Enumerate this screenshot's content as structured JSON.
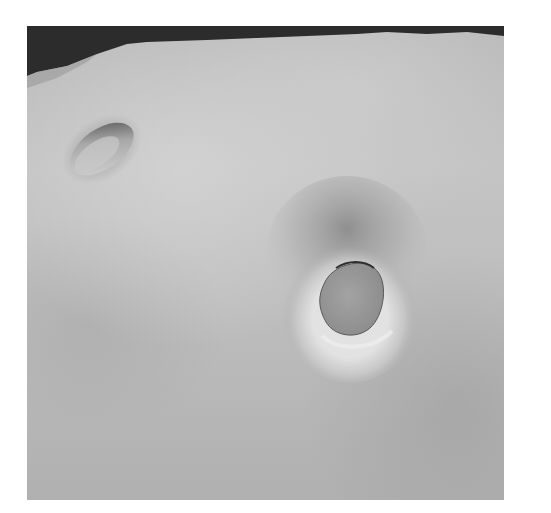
{
  "scene": {
    "description": "Grey shaded 3D surface render with two holes",
    "background_color": "#2e2e2e",
    "surface_color": "#bdbdbd",
    "objects": [
      {
        "name": "small-hole",
        "shape": "elliptical opening",
        "position": "upper-left"
      },
      {
        "name": "large-hole",
        "shape": "rounded opening with raised rim",
        "position": "center-right"
      }
    ]
  }
}
